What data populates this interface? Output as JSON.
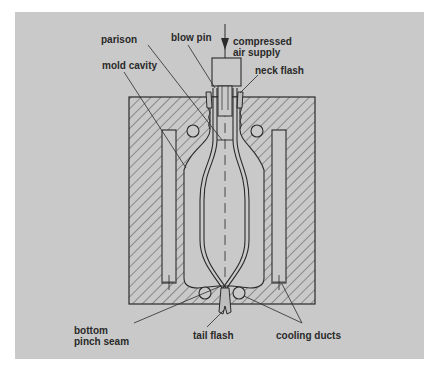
{
  "diagram": {
    "type": "extrusion blow molding cross-section",
    "colors": {
      "background": "#c9c9c9",
      "line": "#2a2a2a",
      "page": "#ffffff"
    },
    "labels": {
      "parison": "parison",
      "blow_pin": "blow pin",
      "compressed_air_supply_line1": "compressed",
      "compressed_air_supply_line2": "air supply",
      "neck_flash": "neck flash",
      "mold_cavity": "mold cavity",
      "bottom_pinch_seam_line1": "bottom",
      "bottom_pinch_seam_line2": "pinch seam",
      "tail_flash": "tail flash",
      "cooling_ducts": "cooling ducts"
    },
    "components": [
      "mold block (hatched)",
      "mold cavity",
      "parison",
      "blow pin",
      "compressed air supply arrow",
      "neck flash",
      "cooling ducts",
      "bottom pinch seam",
      "tail flash"
    ]
  }
}
